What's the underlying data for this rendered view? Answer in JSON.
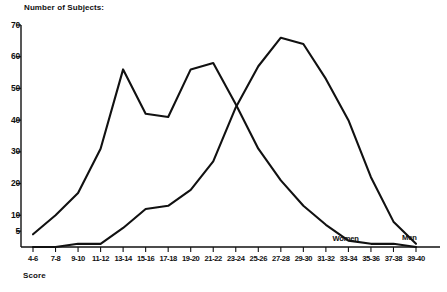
{
  "chart_data": {
    "type": "line",
    "title": "Number of Subjects:",
    "xlabel": "Score",
    "ylabel": "Number of Subjects:",
    "grid": false,
    "legend_position": "inline-right",
    "categories": [
      "4-6",
      "7-8",
      "9-10",
      "11-12",
      "13-14",
      "15-16",
      "17-18",
      "19-20",
      "21-22",
      "23-24",
      "25-26",
      "27-28",
      "29-30",
      "31-32",
      "33-34",
      "35-36",
      "37-38",
      "39-40"
    ],
    "ylim": [
      0,
      70
    ],
    "ytick_values": [
      5,
      10,
      20,
      30,
      40,
      50,
      60,
      70
    ],
    "ytick_labels": [
      "5",
      "10",
      "20",
      "30",
      "40",
      "50",
      "60",
      "70"
    ],
    "series": [
      {
        "name": "Women",
        "values": [
          4,
          10,
          17,
          31,
          56,
          42,
          41,
          56,
          58,
          45,
          31,
          21,
          13,
          7,
          2,
          1,
          1,
          0
        ]
      },
      {
        "name": "Men",
        "values": [
          0,
          0,
          1,
          1,
          6,
          12,
          13,
          18,
          27,
          44,
          57,
          66,
          64,
          53,
          40,
          22,
          8,
          1
        ]
      }
    ],
    "annotations": [
      {
        "text": "Women",
        "category": "33-34"
      },
      {
        "text": "Men",
        "category": "39-40"
      }
    ]
  }
}
